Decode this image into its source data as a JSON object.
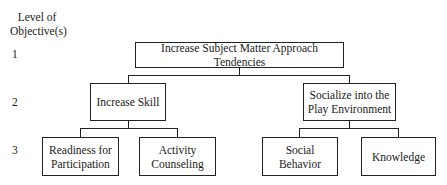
{
  "axis_label": {
    "line1": "Level of",
    "line2": "Objective(s)"
  },
  "levels": [
    "1",
    "2",
    "3"
  ],
  "nodes": {
    "root": "Increase Subject Matter Approach Tendencies",
    "skill": "Increase Skill",
    "socialize": {
      "line1": "Socialize into the",
      "line2": "Play Environment"
    },
    "readiness": {
      "line1": "Readiness for",
      "line2": "Participation"
    },
    "activity": {
      "line1": "Activity",
      "line2": "Counseling"
    },
    "social": {
      "line1": "Social",
      "line2": "Behavior"
    },
    "knowledge": "Knowledge"
  }
}
